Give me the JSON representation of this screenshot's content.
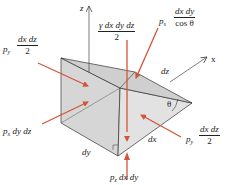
{
  "diagram": {
    "type": "free-body diagram of fluid wedge element",
    "axes": {
      "z_label": "z",
      "x_label": "x"
    },
    "dimensions": {
      "dy": "dy",
      "dx": "dx",
      "dz": "dz",
      "angle": "θ"
    },
    "forces": {
      "weight": {
        "numerator": "γ dx dy dz",
        "denominator": "2"
      },
      "slant_pressure": {
        "prefix": "p",
        "sub": "s",
        "numerator": "dx dy",
        "denominator": "cos θ"
      },
      "left_pressure": {
        "prefix": "p",
        "sub": "y",
        "numerator": "dx dz",
        "denominator": "2"
      },
      "right_pressure": {
        "prefix": "p",
        "sub": "y",
        "numerator": "dx dz",
        "denominator": "2"
      },
      "back_pressure": {
        "prefix": "p",
        "sub": "x",
        "text": "dy dz"
      },
      "bottom_pressure": {
        "prefix": "p",
        "sub": "z",
        "text": "dx dy"
      }
    },
    "colors": {
      "force_arrow": "#d2553a",
      "face_fill": "#d9d9d9",
      "face_fill_light": "#e6e6e6",
      "edge": "#333333",
      "axis": "#444444"
    }
  }
}
